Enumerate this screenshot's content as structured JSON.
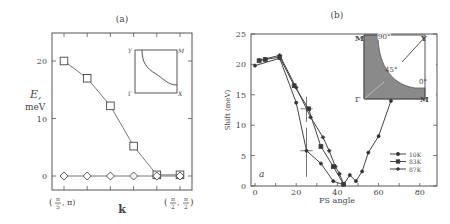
{
  "chart_data": [
    {
      "panel": "(a)",
      "type": "line",
      "title": "(a)",
      "xlabel": "k",
      "ylabel": "E, meV",
      "ylabel_parts": [
        "E,",
        "meV"
      ],
      "x_tick_labels": [
        "(π/5, π)",
        "(π/2, π/2)"
      ],
      "x_tick_labels_parts": [
        [
          "(",
          "π",
          "5",
          ", π)"
        ],
        [
          "(",
          "π",
          "2",
          ", ",
          "π",
          "2",
          ")"
        ]
      ],
      "yticks": [
        0,
        10,
        20
      ],
      "ylim": [
        -2.5,
        25
      ],
      "x": [
        1,
        2,
        3,
        4,
        5,
        6
      ],
      "series": [
        {
          "name": "squares",
          "marker": "square",
          "values": [
            20,
            17,
            12.2,
            5.2,
            0.2,
            0.2
          ]
        },
        {
          "name": "diamonds",
          "marker": "diamond",
          "values": [
            0,
            0,
            0,
            0,
            0,
            0
          ]
        }
      ],
      "inset": {
        "labels": {
          "top_left": "Y",
          "top_right": "M",
          "bottom_left": "Γ",
          "bottom_right": "X"
        }
      }
    },
    {
      "panel": "(b)",
      "type": "line",
      "title": "(b)",
      "xlabel": "FS angle",
      "ylabel": "Shift (meV)",
      "xticks": [
        0,
        20,
        40,
        60,
        80
      ],
      "yticks": [
        0,
        5,
        10,
        15,
        20,
        25
      ],
      "xlim": [
        -2,
        88
      ],
      "ylim": [
        0,
        25
      ],
      "annotation": "a",
      "legend_position": "lower right",
      "series": [
        {
          "name": "10K",
          "marker": "dot",
          "x": [
            0,
            12,
            20,
            25,
            32,
            38,
            43,
            46,
            49,
            52,
            55,
            60,
            66
          ],
          "y": [
            19.8,
            21,
            13.7,
            5.8,
            3.7,
            0.8,
            0.2,
            1.8,
            0.8,
            2.4,
            5.5,
            8.2,
            14
          ]
        },
        {
          "name": "83K",
          "marker": "square",
          "x": [
            2,
            5,
            12,
            19,
            26,
            32,
            38,
            43
          ],
          "y": [
            20.6,
            20.8,
            21.2,
            16.5,
            12.7,
            6.5,
            3.2,
            0.3
          ]
        },
        {
          "name": "87K",
          "marker": "diamond",
          "x": [
            2,
            5,
            12,
            20,
            27,
            33,
            36,
            39,
            41,
            43
          ],
          "y": [
            20.7,
            20.9,
            21.5,
            16.2,
            11.3,
            8.0,
            5.8,
            3.2,
            2.0,
            0.3
          ]
        }
      ],
      "error_bars": [
        {
          "x": 25,
          "y": 12.7,
          "xerr": 3,
          "ylo": 10.5,
          "yhi": 14.7
        },
        {
          "x": 25,
          "y": 5.8,
          "xerr": 3,
          "ylo": 1.5,
          "yhi": 9.6
        }
      ],
      "inset": {
        "labels": {
          "top_left": "M",
          "top_right": "Y",
          "bottom_left": "Γ",
          "bottom_right": "M",
          "angle_top": "90°",
          "angle_mid": "45°",
          "angle_right": "0°"
        }
      }
    }
  ]
}
